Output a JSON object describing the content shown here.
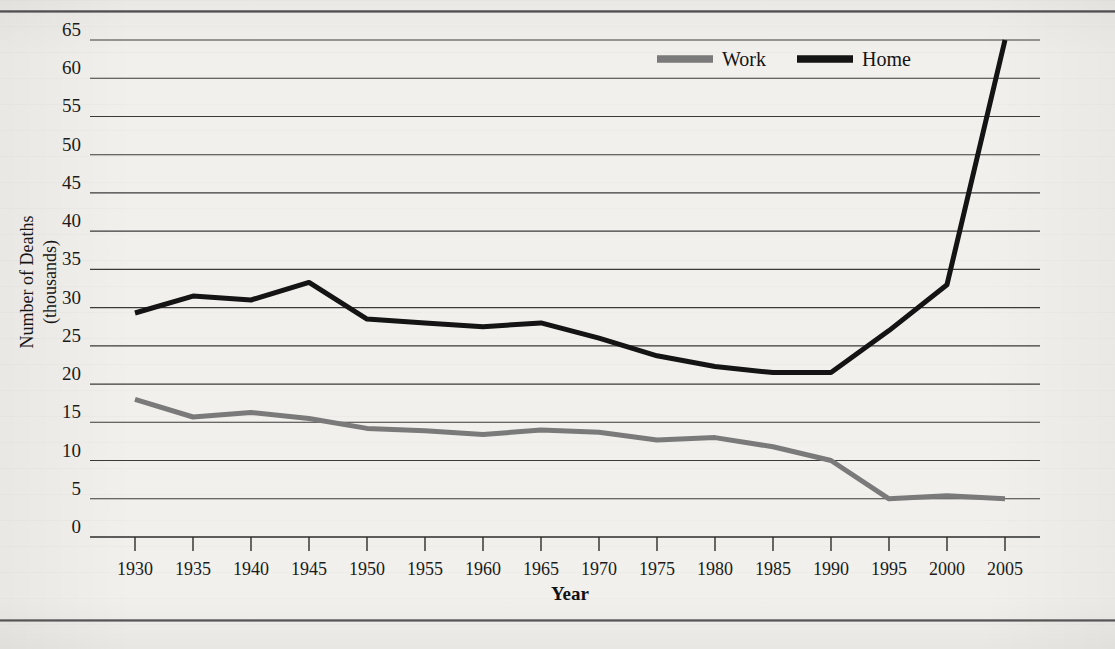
{
  "figure": {
    "background_color": "#f2f0ec",
    "rule_color": "#4a4a4a"
  },
  "chart_data": {
    "type": "line",
    "title": "",
    "xlabel": "Year",
    "ylabel": "Number of Deaths (thousands)",
    "ylabel_line1": "Number of Deaths",
    "ylabel_line2": "(thousands)",
    "x": [
      1930,
      1935,
      1940,
      1945,
      1950,
      1955,
      1960,
      1965,
      1970,
      1975,
      1980,
      1985,
      1990,
      1995,
      2000,
      2005
    ],
    "categories": [
      "1930",
      "1935",
      "1940",
      "1945",
      "1950",
      "1955",
      "1960",
      "1965",
      "1970",
      "1975",
      "1980",
      "1985",
      "1990",
      "1995",
      "2000",
      "2005"
    ],
    "series": [
      {
        "name": "Work",
        "color": "#7a7a7a",
        "values": [
          18.0,
          15.7,
          16.3,
          15.5,
          14.2,
          13.9,
          13.4,
          14.0,
          13.7,
          12.7,
          13.0,
          11.8,
          10.0,
          5.0,
          5.4,
          5.0
        ]
      },
      {
        "name": "Home",
        "color": "#141414",
        "values": [
          29.3,
          31.5,
          31.0,
          33.3,
          28.5,
          28.0,
          27.5,
          28.0,
          26.0,
          23.7,
          22.3,
          21.5,
          21.5,
          27.0,
          33.0,
          65.0
        ]
      }
    ],
    "ylim": [
      0,
      65
    ],
    "ytick_values": [
      0,
      5,
      10,
      15,
      20,
      25,
      30,
      35,
      40,
      45,
      50,
      55,
      60,
      65
    ],
    "ytick_labels": [
      "0",
      "5",
      "10",
      "15",
      "20",
      "25",
      "30",
      "35",
      "40",
      "45",
      "50",
      "55",
      "60",
      "65"
    ],
    "xlim": [
      1930,
      2005
    ],
    "grid": true,
    "grid_axis": "y",
    "legend_position": "top-right-inside",
    "legend": [
      {
        "label": "Work",
        "color": "#7a7a7a",
        "swatch": "line-swatch-gray"
      },
      {
        "label": "Home",
        "color": "#141414",
        "swatch": "line-swatch-black"
      }
    ]
  }
}
